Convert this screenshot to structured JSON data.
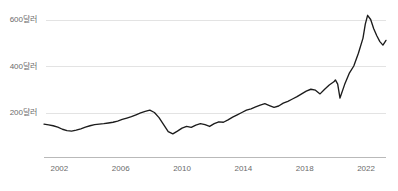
{
  "chart_data": {
    "type": "line",
    "title": "",
    "subtitle": "",
    "xlabel": "",
    "ylabel": "",
    "grid": true,
    "legend": false,
    "legend_position": "none",
    "line_color": "#1c1c1c",
    "grid_color": "#e3e3e3",
    "axis_color": "#b9b9b9",
    "tick_label_color": "#6b6b6b",
    "xlim": [
      2001.0,
      2023.3
    ],
    "ylim": [
      0,
      680
    ],
    "xticks": [
      2002,
      2006,
      2010,
      2014,
      2018,
      2022
    ],
    "xtick_labels": [
      "2002",
      "2006",
      "2010",
      "2014",
      "2018",
      "2022"
    ],
    "yticks": [
      200,
      400,
      600
    ],
    "ytick_labels": [
      "200달러",
      "400달러",
      "600달러"
    ],
    "series": [
      {
        "name": "",
        "x": [
          2001.0,
          2001.3,
          2001.6,
          2001.9,
          2002.2,
          2002.5,
          2002.8,
          2003.1,
          2003.4,
          2003.7,
          2004.0,
          2004.3,
          2004.6,
          2004.9,
          2005.2,
          2005.5,
          2005.8,
          2006.1,
          2006.4,
          2006.7,
          2007.0,
          2007.3,
          2007.6,
          2007.9,
          2008.2,
          2008.5,
          2008.8,
          2009.1,
          2009.4,
          2009.7,
          2010.0,
          2010.3,
          2010.6,
          2010.9,
          2011.2,
          2011.5,
          2011.8,
          2012.1,
          2012.4,
          2012.7,
          2013.0,
          2013.3,
          2013.6,
          2013.9,
          2014.2,
          2014.5,
          2014.8,
          2015.1,
          2015.4,
          2015.7,
          2016.0,
          2016.3,
          2016.6,
          2016.9,
          2017.2,
          2017.5,
          2017.8,
          2018.1,
          2018.4,
          2018.7,
          2019.0,
          2019.3,
          2019.6,
          2019.9,
          2020.0,
          2020.15,
          2020.3,
          2020.6,
          2020.9,
          2021.2,
          2021.5,
          2021.8,
          2021.95,
          2022.1,
          2022.3,
          2022.5,
          2022.7,
          2022.9,
          2023.1,
          2023.3
        ],
        "values": [
          150,
          147,
          143,
          137,
          128,
          122,
          120,
          124,
          130,
          137,
          143,
          148,
          150,
          152,
          155,
          158,
          163,
          170,
          176,
          182,
          190,
          198,
          205,
          210,
          200,
          178,
          148,
          118,
          108,
          120,
          133,
          140,
          136,
          146,
          152,
          148,
          140,
          152,
          160,
          158,
          168,
          180,
          190,
          200,
          210,
          216,
          224,
          232,
          238,
          230,
          222,
          228,
          240,
          248,
          258,
          268,
          280,
          292,
          300,
          296,
          280,
          300,
          318,
          332,
          340,
          322,
          262,
          320,
          368,
          400,
          455,
          520,
          580,
          618,
          600,
          560,
          530,
          505,
          490,
          510
        ]
      }
    ],
    "annotations": []
  }
}
